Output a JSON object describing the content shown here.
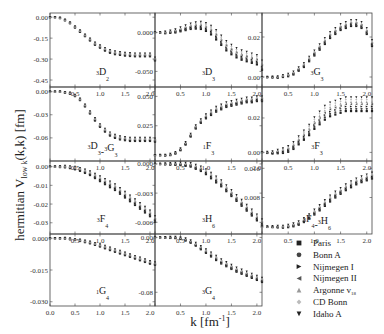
{
  "chart_data": {
    "type": "scatter",
    "layout": "small-multiples 4x3 (11 panels + legend)",
    "ylabel": "hermitian V_low k(k,k) [fm]",
    "xlabel": "k [fm^-1]",
    "xlim": [
      0.0,
      2.1
    ],
    "x_ticks": [
      "0.0",
      "0.5",
      "1.0",
      "1.5",
      "2.0"
    ],
    "legend": [
      "Paris",
      "Bonn A",
      "Nijmegen I",
      "Nijmegen II",
      "Argonne v18",
      "CD Bonn",
      "Idaho A"
    ],
    "legend_markers": [
      "square",
      "circle",
      "triangle-right",
      "triangle-left",
      "triangle-up",
      "diamond",
      "triangle-down"
    ],
    "legend_colors": [
      "#222222",
      "#444444",
      "#222222",
      "#555555",
      "#999999",
      "#bbbbbb",
      "#222222"
    ],
    "x": [
      0.0,
      0.1,
      0.2,
      0.3,
      0.4,
      0.5,
      0.6,
      0.7,
      0.8,
      0.9,
      1.0,
      1.1,
      1.2,
      1.3,
      1.4,
      1.5,
      1.6,
      1.7,
      1.8,
      1.9,
      2.0,
      2.1
    ],
    "panels": [
      {
        "name": "3D2",
        "label": "D",
        "sup": "3",
        "sub": "2",
        "row": 0,
        "col": 0,
        "ylim": [
          -0.5,
          0.03
        ],
        "y_ticks": [
          "0.00",
          "-0.15",
          "-0.30",
          "-0.45"
        ],
        "y_tick_values": [
          0.0,
          -0.15,
          -0.3,
          -0.45
        ],
        "values": [
          0.0,
          0.0,
          -0.005,
          -0.02,
          -0.04,
          -0.07,
          -0.1,
          -0.13,
          -0.16,
          -0.19,
          -0.21,
          -0.23,
          -0.245,
          -0.255,
          -0.26,
          -0.265,
          -0.268,
          -0.27,
          -0.27,
          -0.27,
          -0.27,
          -0.3
        ],
        "spread": 0.01
      },
      {
        "name": "3D3",
        "label": "D",
        "sup": "3",
        "sub": "3",
        "row": 0,
        "col": 1,
        "ylim": [
          -0.07,
          0.025
        ],
        "y_ticks": [
          "0.000",
          "-0.050"
        ],
        "y_tick_values": [
          0.0,
          -0.05
        ],
        "values": [
          0.0,
          0.0,
          0.0,
          0.001,
          0.002,
          0.004,
          0.006,
          0.008,
          0.009,
          0.009,
          0.007,
          0.003,
          -0.003,
          -0.01,
          -0.017,
          -0.022,
          -0.026,
          -0.029,
          -0.031,
          -0.033,
          -0.035,
          -0.042
        ],
        "spread": 0.006
      },
      {
        "name": "3G3",
        "label": "G",
        "sup": "3",
        "sub": "3",
        "row": 0,
        "col": 2,
        "ylim": [
          -0.005,
          0.032
        ],
        "y_ticks": [
          "0.02",
          "0.00"
        ],
        "y_tick_values": [
          0.02,
          0.0
        ],
        "values": [
          0.0,
          0.0,
          0.0,
          0.0,
          0.0005,
          0.001,
          0.002,
          0.004,
          0.006,
          0.009,
          0.012,
          0.015,
          0.018,
          0.021,
          0.023,
          0.025,
          0.026,
          0.027,
          0.027,
          0.026,
          0.023,
          0.017
        ],
        "spread": 0.0015
      },
      {
        "name": "3D3-3G3",
        "label": "D",
        "sup": "3",
        "sub": "3",
        "label2": "G",
        "sup2": "3",
        "sub2": "3",
        "row": 1,
        "col": 0,
        "ylim": [
          -0.09,
          0.006
        ],
        "y_ticks": [
          "0.00",
          "-0.03",
          "-0.06"
        ],
        "y_tick_values": [
          0.0,
          -0.03,
          -0.06
        ],
        "values": [
          0.0,
          0.0,
          0.0,
          -0.001,
          -0.002,
          -0.005,
          -0.01,
          -0.018,
          -0.027,
          -0.036,
          -0.044,
          -0.05,
          -0.055,
          -0.058,
          -0.06,
          -0.061,
          -0.062,
          -0.062,
          -0.062,
          -0.062,
          -0.062,
          -0.063
        ],
        "spread": 0.002
      },
      {
        "name": "1F3",
        "label": "F",
        "sup": "1",
        "sub": "3",
        "row": 1,
        "col": 1,
        "ylim": [
          -0.005,
          0.058
        ],
        "y_ticks": [
          "0.050",
          "0.025"
        ],
        "y_tick_values": [
          0.05,
          0.025
        ],
        "values": [
          0.0,
          0.0,
          0.0,
          0.0005,
          0.002,
          0.005,
          0.01,
          0.017,
          0.024,
          0.029,
          0.033,
          0.036,
          0.039,
          0.041,
          0.043,
          0.044,
          0.045,
          0.046,
          0.047,
          0.047,
          0.048,
          0.048
        ],
        "spread": 0.002
      },
      {
        "name": "3F3",
        "label": "F",
        "sup": "3",
        "sub": "3",
        "row": 1,
        "col": 2,
        "ylim": [
          -0.005,
          0.038
        ],
        "y_ticks": [
          "0.02",
          "0.00"
        ],
        "y_tick_values": [
          0.02,
          0.0
        ],
        "values": [
          0.0,
          0.0,
          0.0,
          0.0005,
          0.001,
          0.002,
          0.004,
          0.007,
          0.01,
          0.013,
          0.017,
          0.02,
          0.023,
          0.025,
          0.026,
          0.027,
          0.028,
          0.028,
          0.028,
          0.028,
          0.028,
          0.028
        ],
        "spread": 0.004
      },
      {
        "name": "3F4",
        "label": "F",
        "sup": "3",
        "sub": "4",
        "row": 2,
        "col": 0,
        "ylim": [
          -0.036,
          0.003
        ],
        "y_ticks": [
          "0.00",
          "-0.01",
          "-0.02",
          "-0.03"
        ],
        "y_tick_values": [
          0.0,
          -0.01,
          -0.02,
          -0.03
        ],
        "values": [
          0.0,
          0.0,
          0.0,
          0.0,
          -0.0003,
          -0.0008,
          -0.0015,
          -0.0025,
          -0.0035,
          -0.005,
          -0.0065,
          -0.008,
          -0.0095,
          -0.011,
          -0.013,
          -0.015,
          -0.017,
          -0.019,
          -0.021,
          -0.023,
          -0.025,
          -0.028
        ],
        "spread": 0.0015
      },
      {
        "name": "3H6",
        "label": "H",
        "sup": "3",
        "sub": "6",
        "row": 2,
        "col": 1,
        "ylim": [
          -0.0072,
          0.0003
        ],
        "y_ticks": [
          "0.000",
          "-0.003",
          "-0.006"
        ],
        "y_tick_values": [
          0.0,
          -0.003,
          -0.006
        ],
        "values": [
          0.0,
          0.0,
          0.0,
          0.0,
          0.0,
          0.0,
          -5e-05,
          -0.0001,
          -0.0003,
          -0.0005,
          -0.0008,
          -0.0012,
          -0.0016,
          -0.002,
          -0.0025,
          -0.003,
          -0.0035,
          -0.004,
          -0.0045,
          -0.005,
          -0.0055,
          -0.006
        ],
        "spread": 0.0003
      },
      {
        "name": "3F4-3H6",
        "label": "F",
        "sup": "3",
        "sub": "4",
        "label2": "H",
        "sup2": "3",
        "sub2": "6",
        "row": 2,
        "col": 2,
        "ylim": [
          -0.002,
          0.018
        ],
        "y_ticks": [
          "0.016",
          "0.008"
        ],
        "y_tick_values": [
          0.016,
          0.008
        ],
        "values": [
          0.0,
          0.0,
          0.0,
          0.0,
          0.0,
          0.0002,
          0.0005,
          0.001,
          0.0018,
          0.0028,
          0.004,
          0.0052,
          0.0065,
          0.0077,
          0.0088,
          0.0098,
          0.0108,
          0.0116,
          0.0124,
          0.013,
          0.0135,
          0.014
        ],
        "spread": 0.0008
      },
      {
        "name": "1G4",
        "label": "G",
        "sup": "1",
        "sub": "4",
        "row": 3,
        "col": 0,
        "ylim": [
          -0.032,
          0.002
        ],
        "y_ticks": [
          "0.000",
          "-0.015",
          "-0.030"
        ],
        "y_tick_values": [
          0.0,
          -0.015,
          -0.03
        ],
        "values": [
          0.0,
          0.0,
          0.0,
          0.0,
          -0.0003,
          -0.0006,
          -0.001,
          -0.0015,
          -0.002,
          -0.0027,
          -0.0034,
          -0.0042,
          -0.005,
          -0.0058,
          -0.0066,
          -0.0074,
          -0.0082,
          -0.009,
          -0.0098,
          -0.0106,
          -0.0114,
          -0.012
        ],
        "spread": 0.0006
      },
      {
        "name": "3G4",
        "label": "G",
        "sup": "3",
        "sub": "4",
        "row": 3,
        "col": 1,
        "ylim": [
          -0.1,
          0.005
        ],
        "y_ticks": [
          "0.00",
          "-0.08"
        ],
        "y_tick_values": [
          0.0,
          -0.08
        ],
        "values": [
          0.0,
          0.0,
          0.0,
          0.0,
          0.0,
          -0.001,
          -0.003,
          -0.006,
          -0.01,
          -0.015,
          -0.02,
          -0.025,
          -0.03,
          -0.035,
          -0.039,
          -0.043,
          -0.047,
          -0.05,
          -0.053,
          -0.056,
          -0.059,
          -0.062
        ],
        "spread": 0.003
      }
    ]
  }
}
